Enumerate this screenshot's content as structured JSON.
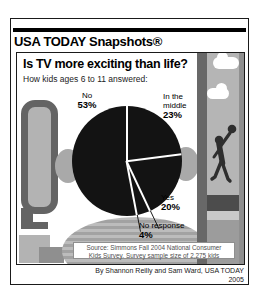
{
  "masthead": {
    "brand": "USA TODAY Snapshots®"
  },
  "infographic": {
    "title": "Is TV more exciting than life?",
    "subtitle": "How kids ages 6 to 11 answered:",
    "source_line1": "Source: Simmons Fall 2004 National Consumer",
    "source_line2": "Kids Survey. Survey sample size of 2,275 kids",
    "byline": "By Shannon Reilly and Sam Ward, USA TODAY",
    "year": "2005"
  },
  "callouts": {
    "no": {
      "line1": "No",
      "pct": "53%"
    },
    "middle": {
      "line1": "In the",
      "line2": "middle",
      "pct": "23%"
    },
    "yes": {
      "line1": "Yes",
      "pct": "20%"
    },
    "no_response": {
      "line1": "No response",
      "pct": "4%"
    }
  },
  "chart_data": {
    "type": "pie",
    "title": "Is TV more exciting than life?",
    "subtitle": "How kids ages 6 to 11 answered:",
    "unit": "%",
    "slices": [
      {
        "label": "In the middle",
        "value": 23
      },
      {
        "label": "Yes",
        "value": 20
      },
      {
        "label": "No response",
        "value": 4
      },
      {
        "label": "No",
        "value": 53
      }
    ],
    "start_angle_deg": 0,
    "direction": "clockwise",
    "style": "all slices solid black, separated by thin white divider lines, external callout labels",
    "source": "Simmons Fall 2004 National Consumer Kids Survey. Survey sample size of 2,275 kids"
  },
  "colors": {
    "pie-black": "#131313",
    "dark-gray": "#646464",
    "light-gray": "#b3b3b3"
  }
}
